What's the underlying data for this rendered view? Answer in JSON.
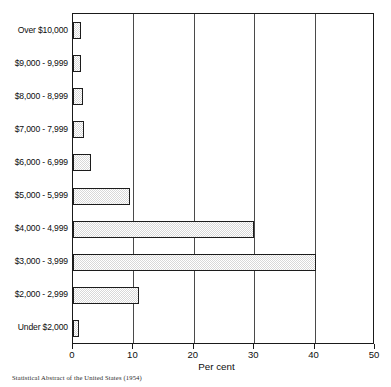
{
  "chart_data": {
    "type": "bar",
    "orientation": "horizontal",
    "title": "",
    "xlabel": "Per cent",
    "ylabel": "",
    "xlim": [
      0,
      50
    ],
    "ylim": null,
    "grid": true,
    "legend": null,
    "source_note": "Statistical Abstract of the United States (1954)",
    "xticks": [
      0,
      10,
      20,
      30,
      40,
      50
    ],
    "xtick_labels": [
      "0",
      "10",
      "20",
      "30",
      "40",
      "50"
    ],
    "categories": [
      "Over $10,000",
      "$9,000 - 9,999",
      "$8,000 - 8,999",
      "$7,000 - 7,999",
      "$6,000 - 6,999",
      "$5,000 - 5,999",
      "$4,000 - 4,999",
      "$3,000 - 3,999",
      "$2,000 - 2,999",
      "Under $2,000"
    ],
    "values": [
      1.3,
      1.3,
      1.7,
      1.8,
      3.0,
      9.5,
      30.0,
      40.2,
      11.0,
      1.0
    ],
    "bar_fill_color": "#d8d8d8",
    "bar_edge_color": "#1c1c1c",
    "axis_color": "#1a1a1a",
    "grid_color": "#4a4a4a",
    "background_color": "#ffffff"
  }
}
